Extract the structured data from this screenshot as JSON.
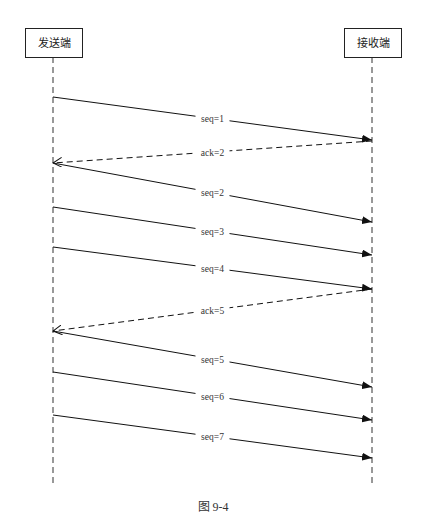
{
  "diagram": {
    "type": "sequence",
    "actors": [
      {
        "id": "sender",
        "label": "发送端",
        "x": 53
      },
      {
        "id": "receiver",
        "label": "接收端",
        "x": 372
      }
    ],
    "messages": [
      {
        "label": "seq=1",
        "from": "sender",
        "to": "receiver",
        "y1": 97,
        "y2": 140,
        "style": "solid"
      },
      {
        "label": "ack=2",
        "from": "receiver",
        "to": "sender",
        "y1": 141,
        "y2": 163,
        "style": "dashed"
      },
      {
        "label": "seq=2",
        "from": "sender",
        "to": "receiver",
        "y1": 163,
        "y2": 222,
        "style": "solid"
      },
      {
        "label": "seq=3",
        "from": "sender",
        "to": "receiver",
        "y1": 207,
        "y2": 255,
        "style": "solid"
      },
      {
        "label": "seq=4",
        "from": "sender",
        "to": "receiver",
        "y1": 247,
        "y2": 289,
        "style": "solid"
      },
      {
        "label": "ack=5",
        "from": "receiver",
        "to": "sender",
        "y1": 289,
        "y2": 331,
        "style": "dashed"
      },
      {
        "label": "seq=5",
        "from": "sender",
        "to": "receiver",
        "y1": 331,
        "y2": 387,
        "style": "solid"
      },
      {
        "label": "seq=6",
        "from": "sender",
        "to": "receiver",
        "y1": 372,
        "y2": 420,
        "style": "solid"
      },
      {
        "label": "seq=7",
        "from": "sender",
        "to": "receiver",
        "y1": 415,
        "y2": 458,
        "style": "solid"
      }
    ],
    "caption": "图 9-4"
  }
}
